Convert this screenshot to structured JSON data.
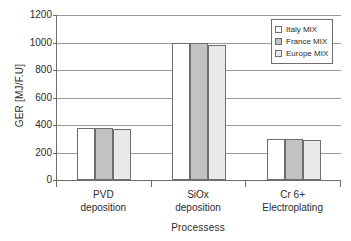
{
  "chart_data": {
    "type": "bar",
    "title": "",
    "subtitle": "",
    "xlabel": "Processess",
    "ylabel": "GER [MJ/F.U]",
    "categories": [
      "PVD deposition",
      "SiOx deposition",
      "Cr 6+ Electroplating"
    ],
    "category_lines": [
      [
        "PVD",
        "deposition"
      ],
      [
        "SiOx",
        "deposition"
      ],
      [
        "Cr 6+",
        "Electroplating"
      ]
    ],
    "series": [
      {
        "name": "Italy MIX",
        "values": [
          378,
          1000,
          300
        ],
        "color": "#ffffff"
      },
      {
        "name": "France MIX",
        "values": [
          378,
          1000,
          300
        ],
        "color": "#c2c2c2"
      },
      {
        "name": "Europe MIX",
        "values": [
          370,
          980,
          290
        ],
        "color": "#e9e9e9"
      }
    ],
    "ylim": [
      0,
      1200
    ],
    "ytick_step": 200,
    "yticks": [
      1200,
      1000,
      800,
      600,
      400,
      200,
      0
    ],
    "ytick_labels": [
      "1200",
      "1000",
      "800",
      "600",
      "400",
      "200",
      "0"
    ],
    "grid": true,
    "grid_axis": "y",
    "legend_position": "top-right",
    "bar_border_color": "#6e6e6e",
    "axis_color": "#6e6e6e",
    "gridline_color": "#9a9a9a",
    "background": "#ffffff"
  }
}
